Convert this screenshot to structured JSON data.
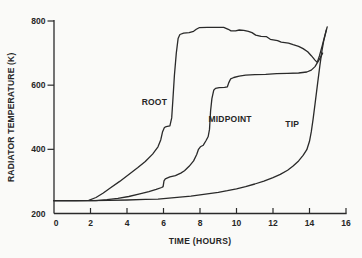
{
  "figure": {
    "background": "#fafaf8",
    "ink_color": "#262626",
    "line_color": "#2a2a2a"
  },
  "chart_data": {
    "type": "line",
    "title": "",
    "xlabel": "TIME (HOURS)",
    "ylabel": "RADIATOR TEMPERATURE (K)",
    "xlim": [
      0,
      16
    ],
    "ylim": [
      200,
      800
    ],
    "x_ticks": [
      0,
      2,
      4,
      6,
      8,
      10,
      12,
      14,
      16
    ],
    "y_ticks": [
      200,
      400,
      600,
      800
    ],
    "grid": false,
    "legend_position": "inline-annotations",
    "annotations": [
      {
        "id": "root",
        "text": "ROOT",
        "x": 5.5,
        "y": 548
      },
      {
        "id": "midpoint",
        "text": "MIDPOINT",
        "x": 9.65,
        "y": 495
      },
      {
        "id": "tip",
        "text": "TIP",
        "x": 13.05,
        "y": 478
      }
    ],
    "series": [
      {
        "name": "ROOT",
        "points": [
          [
            0,
            240
          ],
          [
            1.2,
            240
          ],
          [
            1.9,
            241
          ],
          [
            2.3,
            250
          ],
          [
            2.7,
            264
          ],
          [
            3.1,
            280
          ],
          [
            3.6,
            300
          ],
          [
            4.1,
            322
          ],
          [
            4.6,
            343
          ],
          [
            5.0,
            362
          ],
          [
            5.4,
            385
          ],
          [
            5.7,
            408
          ],
          [
            5.85,
            430
          ],
          [
            5.95,
            455
          ],
          [
            6.05,
            468
          ],
          [
            6.15,
            471
          ],
          [
            6.35,
            473
          ],
          [
            6.45,
            498
          ],
          [
            6.52,
            560
          ],
          [
            6.6,
            630
          ],
          [
            6.7,
            700
          ],
          [
            6.8,
            745
          ],
          [
            6.9,
            758
          ],
          [
            7.1,
            762
          ],
          [
            7.4,
            764
          ],
          [
            7.65,
            768
          ],
          [
            7.8,
            774
          ],
          [
            7.95,
            779
          ],
          [
            8.4,
            780
          ],
          [
            8.9,
            780
          ],
          [
            9.3,
            780
          ],
          [
            9.55,
            774
          ],
          [
            9.7,
            769
          ],
          [
            9.95,
            769
          ],
          [
            10.15,
            772
          ],
          [
            10.4,
            771
          ],
          [
            10.65,
            768
          ],
          [
            10.85,
            764
          ],
          [
            11.05,
            756
          ],
          [
            11.35,
            752
          ],
          [
            11.65,
            751
          ],
          [
            11.85,
            743
          ],
          [
            12.25,
            739
          ],
          [
            12.45,
            734
          ],
          [
            12.85,
            731
          ],
          [
            13.1,
            726
          ],
          [
            13.4,
            721
          ],
          [
            13.65,
            714
          ],
          [
            13.9,
            704
          ],
          [
            14.1,
            692
          ],
          [
            14.3,
            678
          ],
          [
            14.42,
            671
          ],
          [
            14.55,
            692
          ],
          [
            14.7,
            724
          ],
          [
            14.82,
            750
          ],
          [
            14.92,
            772
          ]
        ]
      },
      {
        "name": "MIDPOINT",
        "points": [
          [
            0,
            240
          ],
          [
            2.3,
            240
          ],
          [
            2.9,
            243
          ],
          [
            3.5,
            247
          ],
          [
            4.1,
            253
          ],
          [
            4.7,
            261
          ],
          [
            5.2,
            268
          ],
          [
            5.6,
            275
          ],
          [
            5.9,
            281
          ],
          [
            5.98,
            284
          ],
          [
            6.03,
            302
          ],
          [
            6.1,
            308
          ],
          [
            6.35,
            314
          ],
          [
            6.65,
            318
          ],
          [
            6.95,
            326
          ],
          [
            7.15,
            333
          ],
          [
            7.4,
            347
          ],
          [
            7.65,
            364
          ],
          [
            7.82,
            384
          ],
          [
            7.92,
            400
          ],
          [
            8.02,
            408
          ],
          [
            8.18,
            413
          ],
          [
            8.32,
            426
          ],
          [
            8.45,
            440
          ],
          [
            8.52,
            462
          ],
          [
            8.58,
            520
          ],
          [
            8.65,
            558
          ],
          [
            8.75,
            584
          ],
          [
            8.85,
            590
          ],
          [
            9.05,
            592
          ],
          [
            9.35,
            593
          ],
          [
            9.5,
            595
          ],
          [
            9.57,
            607
          ],
          [
            9.68,
            620
          ],
          [
            9.85,
            624
          ],
          [
            10.15,
            628
          ],
          [
            10.5,
            631
          ],
          [
            11,
            633
          ],
          [
            11.6,
            634
          ],
          [
            12.2,
            636
          ],
          [
            12.8,
            637
          ],
          [
            13.4,
            638
          ],
          [
            13.85,
            641
          ],
          [
            14.1,
            647
          ],
          [
            14.3,
            658
          ],
          [
            14.45,
            672
          ],
          [
            14.6,
            686
          ],
          [
            14.72,
            700
          ]
        ]
      },
      {
        "name": "TIP",
        "points": [
          [
            0,
            240
          ],
          [
            1,
            240
          ],
          [
            2,
            240
          ],
          [
            3,
            241
          ],
          [
            4,
            242
          ],
          [
            5,
            244
          ],
          [
            5.7,
            245
          ],
          [
            6.3,
            248
          ],
          [
            6.9,
            251
          ],
          [
            7.5,
            254
          ],
          [
            8,
            258
          ],
          [
            8.5,
            262
          ],
          [
            9,
            266
          ],
          [
            9.5,
            271
          ],
          [
            10,
            277
          ],
          [
            10.5,
            284
          ],
          [
            11,
            292
          ],
          [
            11.5,
            301
          ],
          [
            12,
            312
          ],
          [
            12.4,
            322
          ],
          [
            12.8,
            335
          ],
          [
            13.1,
            348
          ],
          [
            13.4,
            364
          ],
          [
            13.65,
            381
          ],
          [
            13.85,
            399
          ],
          [
            14.0,
            425
          ],
          [
            14.1,
            455
          ],
          [
            14.2,
            494
          ],
          [
            14.32,
            548
          ],
          [
            14.45,
            608
          ],
          [
            14.57,
            662
          ],
          [
            14.68,
            706
          ],
          [
            14.78,
            738
          ],
          [
            14.88,
            762
          ],
          [
            14.97,
            782
          ]
        ]
      }
    ]
  }
}
